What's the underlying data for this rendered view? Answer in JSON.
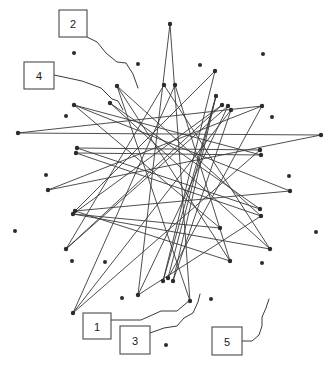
{
  "figure": {
    "background_color": "#ffffff",
    "width": 332,
    "height": 373
  },
  "style": {
    "edge_color": "#3a3a3a",
    "node_color": "#2b2b2b",
    "callout_border_color": "#4a4a4a",
    "callout_fill_color": "#ffffff",
    "text_color": "#1a1a1a"
  },
  "callouts": [
    {
      "label": "1",
      "box": {
        "x": 83,
        "y": 313,
        "w": 28,
        "h": 26
      },
      "leader": "111,320 141,320 161,311 177,311 190,300"
    },
    {
      "label": "2",
      "box": {
        "x": 59,
        "y": 10,
        "w": 28,
        "h": 27
      },
      "leader": "87,37 97,42 106,53 117,62 126,63 133,74 138,88"
    },
    {
      "label": "3",
      "box": {
        "x": 120,
        "y": 326,
        "w": 30,
        "h": 28
      },
      "leader": "150,333 164,328 177,326 184,318 193,313 198,302 200,294"
    },
    {
      "label": "4",
      "box": {
        "x": 24,
        "y": 62,
        "w": 30,
        "h": 27
      },
      "leader": "54,75 82,81 101,88 112,99 118,101 123,110"
    },
    {
      "label": "5",
      "box": {
        "x": 212,
        "y": 327,
        "w": 30,
        "h": 28
      },
      "leader": "242,341 252,341 259,335 262,326 262,317 266,308 269,299"
    }
  ],
  "nodes": [
    {
      "id": "n1",
      "x": 170,
      "y": 24
    },
    {
      "id": "n2",
      "x": 215,
      "y": 71
    },
    {
      "id": "n3",
      "x": 222,
      "y": 105
    },
    {
      "id": "n4",
      "x": 228,
      "y": 106
    },
    {
      "id": "n5",
      "x": 231,
      "y": 110
    },
    {
      "id": "n6",
      "x": 262,
      "y": 106
    },
    {
      "id": "n7",
      "x": 321,
      "y": 135
    },
    {
      "id": "n8",
      "x": 260,
      "y": 150
    },
    {
      "id": "n9",
      "x": 261,
      "y": 155
    },
    {
      "id": "n10",
      "x": 290,
      "y": 191
    },
    {
      "id": "n11",
      "x": 260,
      "y": 209
    },
    {
      "id": "n12",
      "x": 261,
      "y": 216
    },
    {
      "id": "n13",
      "x": 270,
      "y": 249
    },
    {
      "id": "n14",
      "x": 230,
      "y": 261
    },
    {
      "id": "n15",
      "x": 190,
      "y": 301
    },
    {
      "id": "n16",
      "x": 173,
      "y": 281
    },
    {
      "id": "n17",
      "x": 163,
      "y": 281
    },
    {
      "id": "n18",
      "x": 138,
      "y": 295
    },
    {
      "id": "n19",
      "x": 73,
      "y": 313
    },
    {
      "id": "n20",
      "x": 66,
      "y": 249
    },
    {
      "id": "n21",
      "x": 75,
      "y": 211
    },
    {
      "id": "n22",
      "x": 73,
      "y": 214
    },
    {
      "id": "n23",
      "x": 48,
      "y": 190
    },
    {
      "id": "n24",
      "x": 77,
      "y": 148
    },
    {
      "id": "n25",
      "x": 76,
      "y": 153
    },
    {
      "id": "n26",
      "x": 18,
      "y": 133
    },
    {
      "id": "n27",
      "x": 74,
      "y": 105
    },
    {
      "id": "n28",
      "x": 110,
      "y": 103
    },
    {
      "id": "n29",
      "x": 117,
      "y": 86
    },
    {
      "id": "n30",
      "x": 164,
      "y": 85
    },
    {
      "id": "n31",
      "x": 175,
      "y": 85
    },
    {
      "id": "n32",
      "x": 168,
      "y": 278
    },
    {
      "id": "n33",
      "x": 220,
      "y": 228
    },
    {
      "id": "n34",
      "x": 216,
      "y": 96
    }
  ],
  "free_dots": [
    {
      "x": 74,
      "y": 53
    },
    {
      "x": 138,
      "y": 64
    },
    {
      "x": 200,
      "y": 65
    },
    {
      "x": 263,
      "y": 54
    },
    {
      "x": 66,
      "y": 116
    },
    {
      "x": 272,
      "y": 117
    },
    {
      "x": 46,
      "y": 175
    },
    {
      "x": 289,
      "y": 176
    },
    {
      "x": 15,
      "y": 231
    },
    {
      "x": 316,
      "y": 232
    },
    {
      "x": 72,
      "y": 261
    },
    {
      "x": 105,
      "y": 262
    },
    {
      "x": 262,
      "y": 263
    },
    {
      "x": 122,
      "y": 298
    },
    {
      "x": 211,
      "y": 299
    },
    {
      "x": 166,
      "y": 345
    }
  ],
  "edges": [
    [
      "n1",
      "n15"
    ],
    [
      "n1",
      "n18"
    ],
    [
      "n2",
      "n21"
    ],
    [
      "n3",
      "n22"
    ],
    [
      "n4",
      "n20"
    ],
    [
      "n5",
      "n19"
    ],
    [
      "n6",
      "n23"
    ],
    [
      "n7",
      "n26"
    ],
    [
      "n8",
      "n24"
    ],
    [
      "n9",
      "n25"
    ],
    [
      "n10",
      "n27"
    ],
    [
      "n11",
      "n28"
    ],
    [
      "n12",
      "n29"
    ],
    [
      "n13",
      "n30"
    ],
    [
      "n14",
      "n31"
    ],
    [
      "n16",
      "n34"
    ],
    [
      "n17",
      "n2"
    ],
    [
      "n32",
      "n6"
    ],
    [
      "n33",
      "n27"
    ],
    [
      "n21",
      "n10"
    ],
    [
      "n22",
      "n13"
    ],
    [
      "n23",
      "n7"
    ],
    [
      "n24",
      "n11"
    ],
    [
      "n25",
      "n12"
    ],
    [
      "n26",
      "n6"
    ],
    [
      "n27",
      "n9"
    ],
    [
      "n28",
      "n13"
    ],
    [
      "n29",
      "n14"
    ],
    [
      "n30",
      "n20"
    ],
    [
      "n31",
      "n19"
    ],
    [
      "n15",
      "n29"
    ],
    [
      "n18",
      "n4"
    ],
    [
      "n19",
      "n8"
    ],
    [
      "n20",
      "n3"
    ],
    [
      "n14",
      "n21"
    ],
    [
      "n32",
      "n34"
    ],
    [
      "n16",
      "n5"
    ],
    [
      "n17",
      "n34"
    ],
    [
      "n33",
      "n22"
    ],
    [
      "n12",
      "n18"
    ]
  ]
}
